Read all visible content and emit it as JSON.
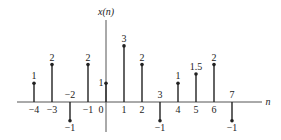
{
  "chart_data": {
    "type": "stem",
    "title": "",
    "ylabel": "x(n)",
    "xlabel": "n",
    "x": [
      -4,
      -3,
      -2,
      -1,
      0,
      1,
      2,
      3,
      4,
      5,
      6,
      7
    ],
    "values": [
      1,
      2,
      -1,
      2,
      1,
      3,
      2,
      -1,
      1,
      1.5,
      2,
      -1
    ],
    "value_labels": [
      "1",
      "2",
      "−1",
      "2",
      "1",
      "3",
      "2",
      "−1",
      "1",
      "1.5",
      "2",
      "−1"
    ],
    "tick_labels": [
      "−4",
      "−3",
      "−2",
      "−1",
      "0",
      "1",
      "2",
      "3",
      "4",
      "5",
      "6",
      "7"
    ],
    "xlim": [
      -5,
      8.5
    ],
    "ylim": [
      -1.5,
      4
    ],
    "grid": false,
    "legend": null
  },
  "colors": {
    "stem": "#222222",
    "axis": "#555555",
    "text": "#222222",
    "background": "#ffffff"
  }
}
